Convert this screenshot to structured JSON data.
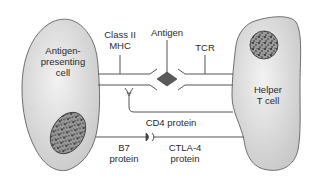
{
  "diagram": {
    "cells": {
      "apc": {
        "label_line1": "Antigen-",
        "label_line2": "presenting",
        "label_line3": "cell"
      },
      "helper": {
        "label_line1": "Helper",
        "label_line2": "T cell"
      }
    },
    "labels": {
      "mhc_line1": "Class II",
      "mhc_line2": "MHC",
      "antigen": "Antigen",
      "tcr": "TCR",
      "cd4": "CD4 protein",
      "b7_line1": "B7",
      "b7_line2": "protein",
      "ctla4_line1": "CTLA-4",
      "ctla4_line2": "protein"
    },
    "colors": {
      "cell_fill": "#d9d9d9",
      "cell_stroke": "#6e6e6e",
      "line": "#555555",
      "antigen_fill": "#5a5a5a",
      "nucleus_fill": "#8a8a8a"
    }
  }
}
